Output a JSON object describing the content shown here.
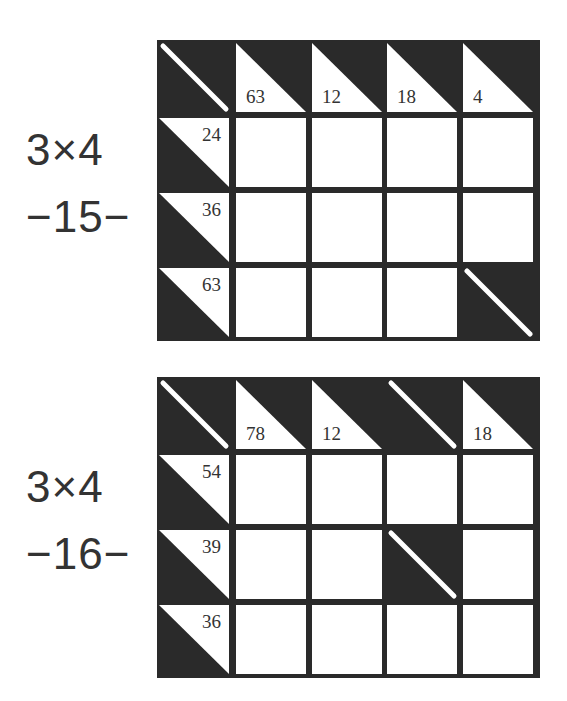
{
  "puzzles": [
    {
      "size_label": "3×4",
      "number_label": "−15−",
      "rows": 4,
      "cols": 5,
      "column_clues": [
        null,
        "63",
        "12",
        "18",
        "4"
      ],
      "row_clues": [
        "24",
        "36",
        "63"
      ],
      "blocked_cells": [
        [
          0,
          0
        ],
        [
          3,
          4
        ]
      ],
      "colors": {
        "block": "#2a2a2a",
        "cell": "#ffffff",
        "text": "#333333"
      }
    },
    {
      "size_label": "3×4",
      "number_label": "−16−",
      "rows": 4,
      "cols": 5,
      "column_clues": [
        null,
        "78",
        "12",
        null,
        "18"
      ],
      "row_clues": [
        "54",
        "39",
        "36"
      ],
      "blocked_cells": [
        [
          0,
          0
        ],
        [
          0,
          3
        ],
        [
          2,
          3
        ]
      ],
      "colors": {
        "block": "#2a2a2a",
        "cell": "#ffffff",
        "text": "#333333"
      }
    }
  ]
}
